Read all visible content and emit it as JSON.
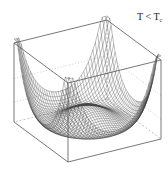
{
  "figure": {
    "label_main": "T < T",
    "label_sub": "c",
    "surface": "double-well (Mexican hat) potential",
    "grid_n": 40,
    "colors": {
      "mesh": "#444444",
      "box": "#555555",
      "hidden": "#999999"
    }
  }
}
